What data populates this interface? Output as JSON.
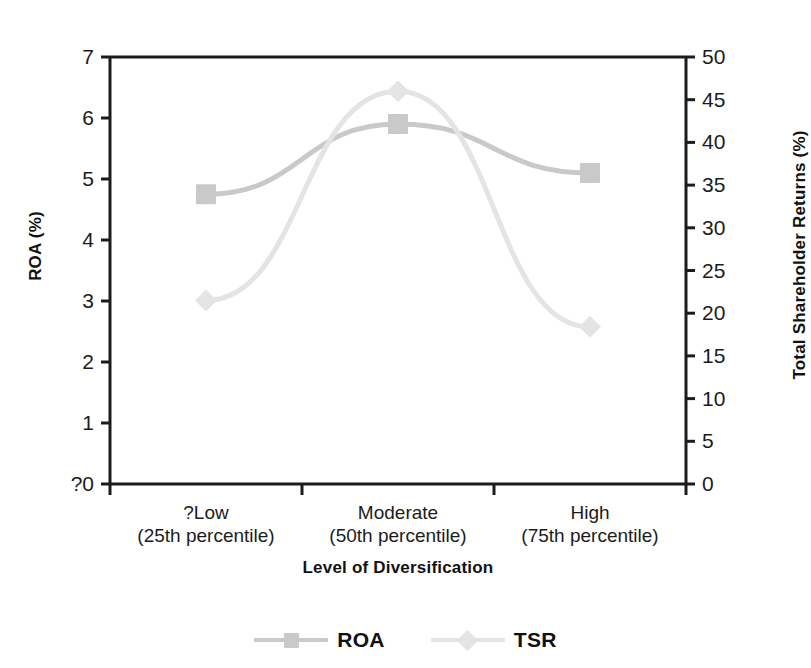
{
  "chart_data": {
    "type": "line",
    "title": "",
    "subtitle": "",
    "xlabel": "Level of Diversification",
    "ylabel": "ROA (%)",
    "y2label": "Total Shareholder Returns (%)",
    "categories": [
      "?Low",
      "Moderate",
      "High"
    ],
    "category_sublabels": [
      "(25th percentile)",
      "(50th percentile)",
      "(75th percentile)"
    ],
    "category_labels_full": [
      "?Low (25th percentile)",
      "Moderate (50th percentile)",
      "High (75th percentile)"
    ],
    "ylim": [
      0,
      7
    ],
    "y2lim": [
      0,
      50
    ],
    "yticks": [
      "?0",
      "1",
      "2",
      "3",
      "4",
      "5",
      "6",
      "7"
    ],
    "ytick_values": [
      0,
      1,
      2,
      3,
      4,
      5,
      6,
      7
    ],
    "y2ticks": [
      "0",
      "5",
      "10",
      "15",
      "20",
      "25",
      "30",
      "35",
      "40",
      "45",
      "50"
    ],
    "y2tick_values": [
      0,
      5,
      10,
      15,
      20,
      25,
      30,
      35,
      40,
      45,
      50
    ],
    "grid": false,
    "legend_position": "bottom",
    "series": [
      {
        "name": "ROA",
        "axis": "left",
        "marker": "square",
        "color": "#c9c9c9",
        "values": [
          4.75,
          5.9,
          5.1
        ]
      },
      {
        "name": "TSR",
        "axis": "right",
        "marker": "diamond",
        "color": "#e4e4e4",
        "values": [
          21.5,
          46.0,
          18.4
        ]
      }
    ]
  },
  "legend": {
    "items": [
      {
        "label": "ROA"
      },
      {
        "label": "TSR"
      }
    ]
  },
  "colors": {
    "background": "#ffffff",
    "axis": "#1c1c1c",
    "text": "#121212",
    "roa_series": "#c9c9c9",
    "tsr_series": "#e4e4e4"
  }
}
